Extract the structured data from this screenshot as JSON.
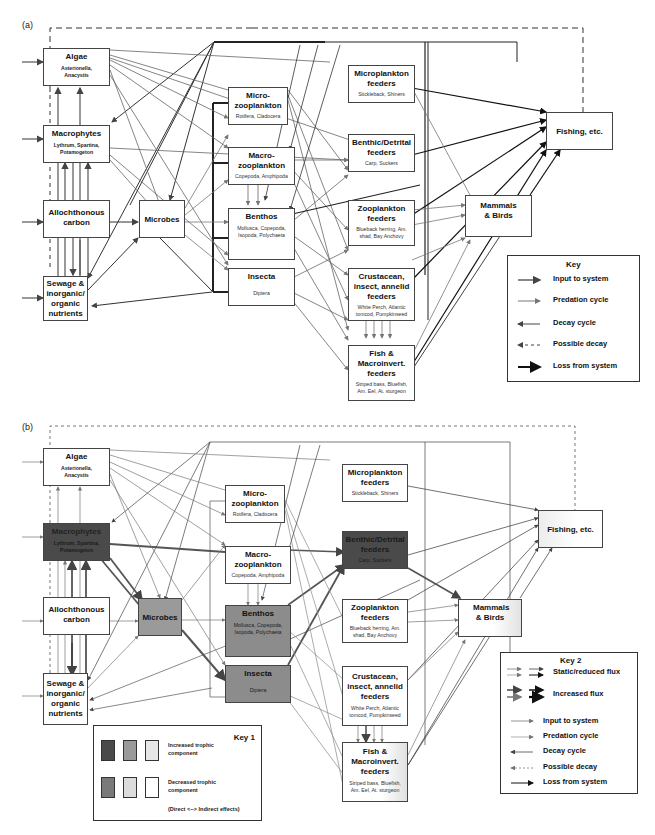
{
  "panels": [
    {
      "label": "(a)"
    },
    {
      "label": "(b)"
    }
  ],
  "nodes": {
    "algae": {
      "title": "Algae",
      "subtitle": "Asterionella, Anacystis"
    },
    "macrophytes": {
      "title": "Macrophytes",
      "subtitle": "Lythrum, Spartina, Potamogeton"
    },
    "allochthonous": {
      "title": "Allochthonous carbon"
    },
    "sewage": {
      "title": "Sewage & inorganic/ organic nutrients"
    },
    "microbes": {
      "title": "Microbes"
    },
    "microzoo": {
      "title": "Micro- zooplankton",
      "subtitle": "Rotifera, Cladocera"
    },
    "macrozoo": {
      "title": "Macro- zooplankton",
      "subtitle": "Copepoda, Amphipoda"
    },
    "benthos": {
      "title": "Benthos",
      "subtitle": "Mollusca, Copepoda, Isopoda, Polychaeta"
    },
    "insecta": {
      "title": "Insecta",
      "subtitle": "Diptera"
    },
    "microplankton_feeders": {
      "title": "Microplankton feeders",
      "subtitle": "Stickleback, Shiners"
    },
    "benthic_feeders": {
      "title": "Benthic/Detrital feeders",
      "subtitle": "Carp, Suckers"
    },
    "zooplankton_feeders": {
      "title": "Zooplankton feeders",
      "subtitle": "Blueback herring, Am. shad, Bay Anchovy"
    },
    "crustacean_feeders": {
      "title": "Crustacean, insect, annelid feeders",
      "subtitle": "White Perch, Atlantic tomcod, Pumpkinseed"
    },
    "fish_feeders": {
      "title": "Fish & Macroinvert. feeders",
      "subtitle": "Striped bass, Bluefish, Am. Eel, At. sturgeon"
    },
    "mammals": {
      "title": "Mammals & Birds"
    },
    "fishing": {
      "title": "Fishing, etc."
    }
  },
  "key_a": {
    "title": "Key",
    "items": [
      "Input to system",
      "Predation cycle",
      "Decay cycle",
      "Possible decay",
      "Loss from system"
    ]
  },
  "key1": {
    "title": "Key 1",
    "increased": "Increased trophic component",
    "decreased": "Decreased trophic component",
    "note": "(Direct <--> Indirect effects)",
    "increased_colors": [
      "#4a4a4a",
      "#9a9a9a",
      "#e6e6e6"
    ],
    "decreased_colors": [
      "#7a7a7a",
      "#dcdcdc",
      "#ffffff"
    ]
  },
  "key2": {
    "title": "Key 2",
    "flux_items": [
      "Static/reduced flux",
      "Increased flux"
    ],
    "items": [
      "Input to system",
      "Predation cycle",
      "Decay cycle",
      "Possible decay",
      "Loss from system"
    ]
  },
  "colors": {
    "dark": "#4a4a4a",
    "mid": "#8c8c8c",
    "light": "#f0f0f0",
    "line": "#444444",
    "predation": "#777777"
  }
}
